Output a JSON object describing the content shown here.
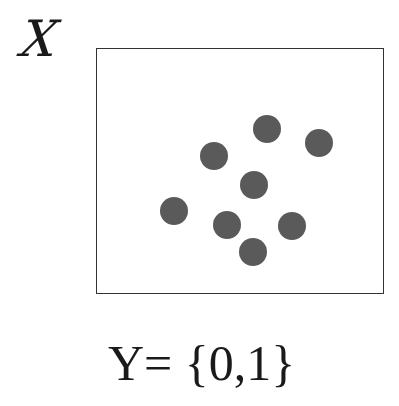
{
  "diagram": {
    "input_space_label": "X",
    "output_space_label": "Y= {0,1}",
    "frame": {
      "x": 96,
      "y": 48,
      "width": 288,
      "height": 246,
      "border_color": "#333333"
    },
    "dot_color": "#5a5a5a",
    "dot_radius": 14,
    "points": [
      {
        "x": 267,
        "y": 129
      },
      {
        "x": 319,
        "y": 143
      },
      {
        "x": 214,
        "y": 156
      },
      {
        "x": 254,
        "y": 185
      },
      {
        "x": 174,
        "y": 211
      },
      {
        "x": 227,
        "y": 225
      },
      {
        "x": 292,
        "y": 226
      },
      {
        "x": 253,
        "y": 252
      }
    ]
  }
}
